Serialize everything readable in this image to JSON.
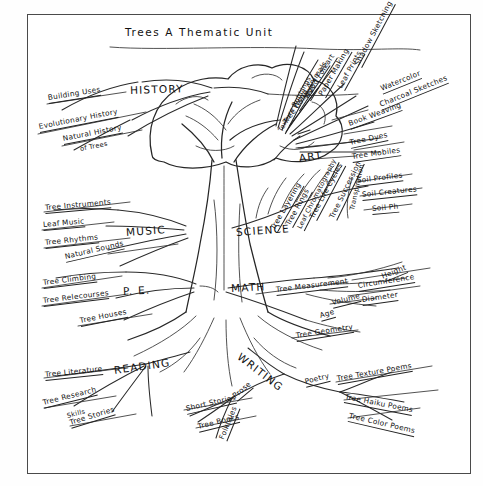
{
  "document": {
    "title": "Trees A Thematic Unit",
    "type": "hand-drawn mind map",
    "medium": "pencil on paper, photocopied",
    "center_image": "tree-drawing"
  },
  "frame": {
    "border_color": "#4a4a4a",
    "paper_color": "#ffffff"
  },
  "branches": [
    {
      "id": "history",
      "label": "HISTORY",
      "items": [
        {
          "label": "Building Uses"
        },
        {
          "label": "Evolutionary History"
        },
        {
          "label": "Natural History"
        },
        {
          "label": "of Trees"
        }
      ]
    },
    {
      "id": "art",
      "label": "ART",
      "items": [
        {
          "label": "Shadow Sketching"
        },
        {
          "label": "Leaf Prints"
        },
        {
          "label": "Watercolor"
        },
        {
          "label": "Paper Making"
        },
        {
          "label": "Charcoal Sketches"
        },
        {
          "label": "Wood Folkart"
        },
        {
          "label": "Book Weaving"
        },
        {
          "label": "Wood Animals"
        },
        {
          "label": "Tree Collage"
        },
        {
          "label": "Tree Dyes"
        },
        {
          "label": "Texture Rubbings"
        },
        {
          "label": "Tree Mobiles"
        }
      ]
    },
    {
      "id": "science",
      "label": "SCIENCE",
      "items": [
        {
          "label": "Tree Layering"
        },
        {
          "label": "Tree Rings"
        },
        {
          "label": "Leaf Chromatography"
        },
        {
          "label": "Tree Life Cycles"
        },
        {
          "label": "Tree Succession"
        },
        {
          "label": "Transpiration"
        },
        {
          "label": "Soil Profiles"
        },
        {
          "label": "Soil Creatures"
        },
        {
          "label": "Soil Ph"
        }
      ]
    },
    {
      "id": "math",
      "label": "MATH",
      "items": [
        {
          "label": "Tree Measurement"
        },
        {
          "label": "Height"
        },
        {
          "label": "Circumference"
        },
        {
          "label": "Diameter"
        },
        {
          "label": "Volume"
        },
        {
          "label": "Age"
        },
        {
          "label": "Tree Geometry"
        }
      ]
    },
    {
      "id": "music",
      "label": "MUSIC",
      "items": [
        {
          "label": "Tree Instruments"
        },
        {
          "label": "Leaf Music"
        },
        {
          "label": "Tree Rhythms"
        },
        {
          "label": "Natural Sounds"
        }
      ]
    },
    {
      "id": "pe",
      "label": "P. E.",
      "items": [
        {
          "label": "Tree Climbing"
        },
        {
          "label": "Tree Relecourses"
        },
        {
          "label": "Tree Houses"
        }
      ]
    },
    {
      "id": "reading",
      "label": "READING",
      "items": [
        {
          "label": "Tree Literature"
        },
        {
          "label": "Tree Research"
        },
        {
          "label": "Skills"
        },
        {
          "label": "Tree Stories"
        }
      ]
    },
    {
      "id": "writing",
      "label": "WRITING",
      "items": [
        {
          "label": "Prose"
        },
        {
          "label": "Short Stories"
        },
        {
          "label": "Tree Books"
        },
        {
          "label": "Folktales"
        },
        {
          "label": "Poetry"
        },
        {
          "label": "Tree Texture Poems"
        },
        {
          "label": "Tree Haiku Poems"
        },
        {
          "label": "Tree Color Poems"
        }
      ]
    }
  ]
}
